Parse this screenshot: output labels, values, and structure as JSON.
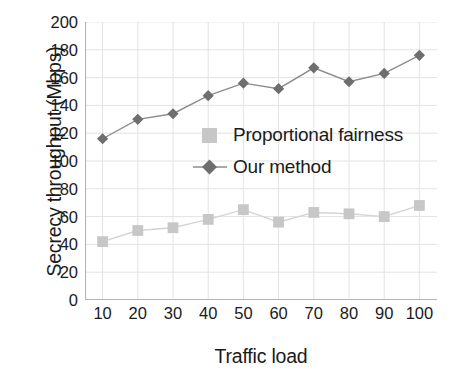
{
  "chart_data": {
    "type": "line",
    "title": "",
    "xlabel": "Traffic load",
    "ylabel": "Secrecy throughput (Mbps)",
    "x": [
      10,
      20,
      30,
      40,
      50,
      60,
      70,
      80,
      90,
      100
    ],
    "xticklabels": [
      "10",
      "20",
      "30",
      "40",
      "50",
      "60",
      "70",
      "80",
      "90",
      "100"
    ],
    "yticklabels": [
      "0",
      "20",
      "40",
      "60",
      "80",
      "100",
      "120",
      "140",
      "160",
      "180",
      "200"
    ],
    "yticks": [
      0,
      20,
      40,
      60,
      80,
      100,
      120,
      140,
      160,
      180,
      200
    ],
    "xlim": [
      5,
      105
    ],
    "ylim": [
      0,
      200
    ],
    "grid": true,
    "legend_position": "center",
    "series": [
      {
        "name": "Proportional fairness",
        "marker": "square",
        "color": "#c7c7c7",
        "line_color": "#d4d4d4",
        "values": [
          42,
          50,
          52,
          58,
          65,
          56,
          63,
          62,
          60,
          68
        ]
      },
      {
        "name": "Our method",
        "marker": "diamond",
        "color": "#6e6e6e",
        "line_color": "#8c8c8c",
        "values": [
          116,
          130,
          134,
          147,
          156,
          152,
          167,
          157,
          163,
          176
        ]
      }
    ]
  },
  "legend": {
    "items": [
      {
        "label": "Proportional fairness",
        "marker": "square-marker-icon"
      },
      {
        "label": "Our method",
        "marker": "diamond-marker-icon"
      }
    ]
  },
  "axes": {
    "x_title": "Traffic load",
    "y_title": "Secrecy throughput (Mbps)"
  },
  "colors": {
    "grid": "#e3e3e3",
    "axis": "#b5b5b5",
    "text": "#1a1a1a",
    "series_light": "#c7c7c7",
    "series_dark": "#6e6e6e"
  }
}
